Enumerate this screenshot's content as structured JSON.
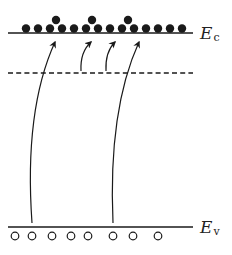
{
  "diagram": {
    "type": "energy-band-diagram",
    "colors": {
      "ink": "#1a1a1a",
      "background": "#ffffff"
    },
    "levels": {
      "conduction_band": {
        "label": "E",
        "subscript": "c",
        "y": 33,
        "x1": 8,
        "x2": 193,
        "style": "solid"
      },
      "trap_level": {
        "y": 73,
        "x1": 8,
        "x2": 193,
        "style": "dashed"
      },
      "valence_band": {
        "label": "E",
        "subscript": "v",
        "y": 227,
        "x1": 8,
        "x2": 193,
        "style": "solid"
      }
    },
    "electrons": {
      "radius": 4.2,
      "bottom_row_y": 28.5,
      "bottom_row_x": [
        26,
        38,
        50,
        62,
        74,
        86,
        98,
        110,
        122,
        134,
        146,
        158,
        170,
        182
      ],
      "top_row_y": 20,
      "top_row_x": [
        56,
        92,
        128
      ]
    },
    "holes": {
      "radius": 3.8,
      "y": 236,
      "x": [
        15,
        32,
        52,
        71,
        88,
        113,
        133,
        158
      ]
    },
    "transitions": [
      {
        "name": "valence-to-conduction-1",
        "from": [
          32,
          223
        ],
        "ctrl": [
          24,
          110
        ],
        "to": [
          55,
          42
        ]
      },
      {
        "name": "trap-to-conduction-1",
        "from": [
          81,
          71
        ],
        "ctrl": [
          80,
          52
        ],
        "to": [
          91,
          42
        ]
      },
      {
        "name": "trap-to-conduction-2",
        "from": [
          106,
          71
        ],
        "ctrl": [
          105,
          52
        ],
        "to": [
          115,
          42
        ]
      },
      {
        "name": "valence-to-conduction-2",
        "from": [
          113,
          223
        ],
        "ctrl": [
          108,
          110
        ],
        "to": [
          139,
          42
        ]
      }
    ]
  }
}
